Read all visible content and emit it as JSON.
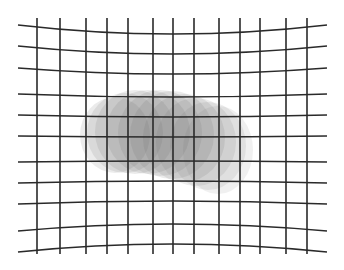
{
  "figure": {
    "background": "#ffffff",
    "grid": {
      "line_color": "#2a2a2a",
      "line_width": 1.6,
      "vertical_x": [
        37,
        60,
        86,
        107,
        128,
        153,
        173,
        194,
        219,
        240,
        260,
        286,
        307
      ],
      "vertical_y_top": 18,
      "vertical_y_bottom": 254,
      "horizontal_x_left": 18,
      "horizontal_x_right": 327,
      "horizontal_edge_y": [
        25,
        46,
        68,
        94,
        115,
        136,
        162,
        183,
        204,
        231,
        252
      ],
      "horizontal_center_y": [
        34,
        54,
        74,
        97,
        117,
        137,
        161,
        181,
        201,
        224,
        244
      ]
    },
    "blob": {
      "color": "#5a5a5a",
      "ellipses": [
        {
          "cx": 115,
          "cy": 135,
          "rx": 35,
          "ry": 38,
          "opacity": 0.12
        },
        {
          "cx": 125,
          "cy": 133,
          "rx": 38,
          "ry": 40,
          "opacity": 0.12
        },
        {
          "cx": 135,
          "cy": 132,
          "rx": 40,
          "ry": 42,
          "opacity": 0.12
        },
        {
          "cx": 148,
          "cy": 132,
          "rx": 42,
          "ry": 42,
          "opacity": 0.12
        },
        {
          "cx": 160,
          "cy": 133,
          "rx": 42,
          "ry": 43,
          "opacity": 0.12
        },
        {
          "cx": 172,
          "cy": 135,
          "rx": 42,
          "ry": 44,
          "opacity": 0.12
        },
        {
          "cx": 184,
          "cy": 138,
          "rx": 41,
          "ry": 44,
          "opacity": 0.12
        },
        {
          "cx": 196,
          "cy": 142,
          "rx": 40,
          "ry": 44,
          "opacity": 0.11
        },
        {
          "cx": 208,
          "cy": 146,
          "rx": 38,
          "ry": 44,
          "opacity": 0.1
        },
        {
          "cx": 218,
          "cy": 150,
          "rx": 35,
          "ry": 44,
          "opacity": 0.09
        }
      ]
    }
  }
}
